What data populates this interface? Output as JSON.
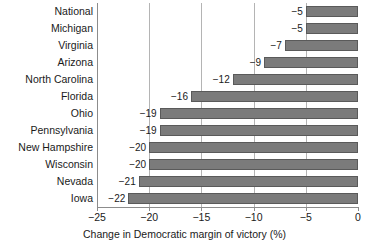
{
  "chart_data": {
    "type": "bar",
    "orientation": "horizontal",
    "title": "",
    "xlabel": "Change in Democratic margin of victory (%)",
    "ylabel": "",
    "xlim": [
      -25,
      0
    ],
    "xticks": [
      "-25",
      "-20",
      "-15",
      "-10",
      "-5",
      "0"
    ],
    "xtick_values": [
      -25,
      -20,
      -15,
      -10,
      -5,
      0
    ],
    "grid": "vertical",
    "legend": "none",
    "bar_color": "#7b7b7b",
    "bar_edge_color": "#5a5a5a",
    "gridline_color": "#b4b4b4",
    "axis_color": "#8c8c8c",
    "categories": [
      "National",
      "Michigan",
      "Virginia",
      "Arizona",
      "North Carolina",
      "Florida",
      "Ohio",
      "Pennsylvania",
      "New Hampshire",
      "Wisconsin",
      "Nevada",
      "Iowa"
    ],
    "values": [
      -5,
      -5,
      -7,
      -9,
      -12,
      -16,
      -19,
      -19,
      -20,
      -20,
      -21,
      -22
    ],
    "data_labels": [
      "-5",
      "-5",
      "-7",
      "-9",
      "-12",
      "-16",
      "-19",
      "-19",
      "-20",
      "-20",
      "-21",
      "-22"
    ]
  }
}
